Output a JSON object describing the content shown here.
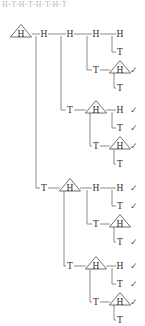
{
  "header": {
    "caption": "H-T-H-T-H-T-H-T"
  },
  "diagram": {
    "root_label": "H",
    "labels": {
      "heads": "H",
      "tails": "T",
      "check": "✓"
    },
    "colors": {
      "edge": "#6e6e6e",
      "triangle": "#4a4a4a",
      "text": "#2f2f2f",
      "check": "#555555",
      "background": "#ffffff",
      "header": "#b9b9b9"
    },
    "nodes": [
      {
        "id": "n0",
        "label": "H",
        "x": 21,
        "y": 34,
        "triangle": true,
        "check": false
      },
      {
        "id": "n1",
        "label": "H",
        "x": 44,
        "y": 34,
        "triangle": false,
        "check": false
      },
      {
        "id": "n2",
        "label": "H",
        "x": 70,
        "y": 34,
        "triangle": false,
        "check": false
      },
      {
        "id": "n3",
        "label": "H",
        "x": 96,
        "y": 34,
        "triangle": false,
        "check": false
      },
      {
        "id": "n4",
        "label": "H",
        "x": 120,
        "y": 34,
        "triangle": false,
        "check": false
      },
      {
        "id": "n5",
        "label": "T",
        "x": 120,
        "y": 52,
        "triangle": false,
        "check": false
      },
      {
        "id": "n6",
        "label": "T",
        "x": 96,
        "y": 70,
        "triangle": false,
        "check": false
      },
      {
        "id": "n7",
        "label": "H",
        "x": 120,
        "y": 70,
        "triangle": true,
        "check": true
      },
      {
        "id": "n8",
        "label": "T",
        "x": 120,
        "y": 88,
        "triangle": false,
        "check": false
      },
      {
        "id": "n9",
        "label": "T",
        "x": 70,
        "y": 110,
        "triangle": false,
        "check": false
      },
      {
        "id": "n10",
        "label": "H",
        "x": 96,
        "y": 110,
        "triangle": true,
        "check": false
      },
      {
        "id": "n11",
        "label": "H",
        "x": 120,
        "y": 110,
        "triangle": false,
        "check": true
      },
      {
        "id": "n12",
        "label": "T",
        "x": 120,
        "y": 128,
        "triangle": false,
        "check": true
      },
      {
        "id": "n13",
        "label": "T",
        "x": 96,
        "y": 146,
        "triangle": false,
        "check": false
      },
      {
        "id": "n14",
        "label": "H",
        "x": 120,
        "y": 146,
        "triangle": true,
        "check": true
      },
      {
        "id": "n15",
        "label": "T",
        "x": 120,
        "y": 164,
        "triangle": false,
        "check": false
      },
      {
        "id": "n16",
        "label": "T",
        "x": 44,
        "y": 188,
        "triangle": false,
        "check": false
      },
      {
        "id": "n17",
        "label": "H",
        "x": 70,
        "y": 188,
        "triangle": true,
        "check": false
      },
      {
        "id": "n18",
        "label": "H",
        "x": 96,
        "y": 188,
        "triangle": false,
        "check": false
      },
      {
        "id": "n19",
        "label": "H",
        "x": 120,
        "y": 188,
        "triangle": false,
        "check": true
      },
      {
        "id": "n20",
        "label": "T",
        "x": 120,
        "y": 206,
        "triangle": false,
        "check": true
      },
      {
        "id": "n21",
        "label": "T",
        "x": 96,
        "y": 224,
        "triangle": false,
        "check": false
      },
      {
        "id": "n22",
        "label": "H",
        "x": 120,
        "y": 224,
        "triangle": true,
        "check": false
      },
      {
        "id": "n23",
        "label": "T",
        "x": 120,
        "y": 242,
        "triangle": false,
        "check": true
      },
      {
        "id": "n24",
        "label": "T",
        "x": 70,
        "y": 266,
        "triangle": false,
        "check": false
      },
      {
        "id": "n25",
        "label": "H",
        "x": 96,
        "y": 266,
        "triangle": true,
        "check": false
      },
      {
        "id": "n26",
        "label": "H",
        "x": 120,
        "y": 266,
        "triangle": false,
        "check": true
      },
      {
        "id": "n27",
        "label": "T",
        "x": 120,
        "y": 284,
        "triangle": false,
        "check": true
      },
      {
        "id": "n28",
        "label": "T",
        "x": 96,
        "y": 302,
        "triangle": false,
        "check": false
      },
      {
        "id": "n29",
        "label": "H",
        "x": 120,
        "y": 302,
        "triangle": true,
        "check": true
      },
      {
        "id": "n30",
        "label": "T",
        "x": 120,
        "y": 320,
        "triangle": false,
        "check": false
      }
    ],
    "checkmark_count": 12
  }
}
